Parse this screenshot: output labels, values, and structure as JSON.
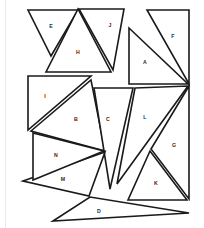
{
  "figure": {
    "canvas": {
      "width": 204,
      "height": 228
    },
    "style": {
      "background_color": "#ffffff",
      "stroke_color": "#1a1a1a",
      "fill_color": "#ffffff",
      "label_color": "#2b2b2b",
      "stroke_width": 1.6,
      "rule_color": "#e9e9e9"
    },
    "shape_type": "triangle",
    "count": 13,
    "labels": [
      "A",
      "B",
      "C",
      "D",
      "E",
      "F",
      "G",
      "H",
      "I",
      "J",
      "K",
      "L",
      "M",
      "N"
    ],
    "pieces": [
      {
        "label": "A",
        "name": "triangle-a",
        "points": "129,28 129,84 188,84",
        "label_x": 145,
        "label_y": 63
      },
      {
        "label": "B",
        "name": "triangle-b",
        "points": "31,131 91,80 105,151",
        "label_x": 76,
        "label_y": 120
      },
      {
        "label": "C",
        "name": "triangle-c",
        "points": "94,88 133,88 110,189",
        "label_x": 108,
        "label_y": 120
      },
      {
        "label": "D",
        "name": "triangle-d",
        "points": "53,221 90,197 189,213",
        "label_x": 99,
        "label_y": 212
      },
      {
        "label": "E",
        "name": "triangle-e",
        "points": "28,10 78,10 51,56",
        "label_x": 51,
        "label_y": 27
      },
      {
        "label": "F",
        "name": "triangle-f",
        "points": "147,10 189,10 189,84",
        "label_x": 173,
        "label_y": 37
      },
      {
        "label": "G",
        "name": "triangle-g",
        "points": "189,86 151,149 189,199",
        "label_x": 174,
        "label_y": 146
      },
      {
        "label": "H",
        "name": "triangle-h",
        "points": "78,9 46,72 111,72",
        "label_x": 78,
        "label_y": 53
      },
      {
        "label": "I",
        "name": "triangle-i",
        "points": "28,76 91,76 28,130",
        "label_x": 45,
        "label_y": 97
      },
      {
        "label": "J",
        "name": "triangle-j",
        "points": "79,9 124,9 113,70",
        "label_x": 110,
        "label_y": 26
      },
      {
        "label": "K",
        "name": "triangle-k",
        "points": "150,151 128,200 187,200",
        "label_x": 156,
        "label_y": 184
      },
      {
        "label": "L",
        "name": "triangle-l",
        "points": "135,88 188,86 117,184",
        "label_x": 145,
        "label_y": 118
      },
      {
        "label": "M",
        "name": "triangle-m",
        "points": "23,181 105,152 89,196",
        "label_x": 63,
        "label_y": 180
      },
      {
        "label": "N",
        "name": "triangle-n",
        "points": "33,133 104,151 33,180",
        "label_x": 56,
        "label_y": 156
      }
    ]
  }
}
